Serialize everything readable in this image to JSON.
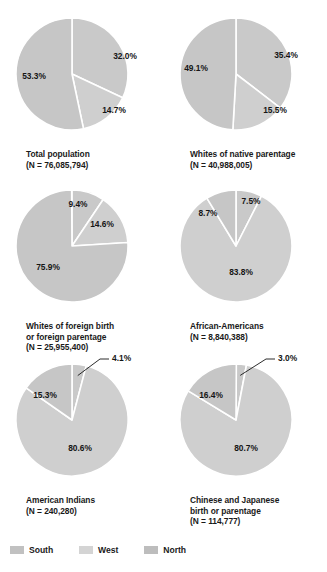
{
  "chart_data": [
    {
      "type": "pie",
      "title": "Total population",
      "subtitle": "(N = 76,085,794)",
      "categories": [
        "South",
        "West",
        "North"
      ],
      "values": [
        32.0,
        14.7,
        53.3
      ],
      "labels": [
        "32.0%",
        "14.7%",
        "53.3%"
      ],
      "start_angle_deg": 0,
      "direction": "clockwise",
      "legend": "bottom"
    },
    {
      "type": "pie",
      "title": "Whites of native parentage",
      "subtitle": "(N = 40,988,005)",
      "categories": [
        "South",
        "West",
        "North"
      ],
      "values": [
        35.4,
        15.5,
        49.1
      ],
      "labels": [
        "35.4%",
        "15.5%",
        "49.1%"
      ],
      "start_angle_deg": 0,
      "direction": "clockwise",
      "legend": "bottom"
    },
    {
      "type": "pie",
      "title_line1": "Whites of foreign birth",
      "title_line2": "or foreign parentage",
      "subtitle": "(N = 25,955,400)",
      "categories": [
        "South",
        "West",
        "North"
      ],
      "values": [
        9.4,
        14.6,
        75.9
      ],
      "labels": [
        "9.4%",
        "14.6%",
        "75.9%"
      ],
      "start_angle_deg": 0,
      "direction": "clockwise",
      "legend": "bottom"
    },
    {
      "type": "pie",
      "title": "African-Americans",
      "subtitle": "(N = 8,840,388)",
      "categories": [
        "South",
        "West",
        "North"
      ],
      "values": [
        7.5,
        83.8,
        8.7
      ],
      "labels": [
        "7.5%",
        "83.8%",
        "8.7%"
      ],
      "start_angle_deg": 0,
      "direction": "clockwise",
      "legend": "bottom"
    },
    {
      "type": "pie",
      "title": "American Indians",
      "subtitle": "(N = 240,280)",
      "categories": [
        "South",
        "West",
        "North"
      ],
      "values": [
        4.1,
        80.6,
        15.3
      ],
      "labels": [
        "4.1%",
        "80.6%",
        "15.3%"
      ],
      "start_angle_deg": 0,
      "direction": "clockwise",
      "legend": "bottom"
    },
    {
      "type": "pie",
      "title_line1": "Chinese and Japanese",
      "title_line2": "birth or parentage",
      "subtitle": "(N = 114,777)",
      "categories": [
        "South",
        "West",
        "North"
      ],
      "values": [
        3.0,
        80.7,
        16.4
      ],
      "labels": [
        "3.0%",
        "80.7%",
        "16.4%"
      ],
      "start_angle_deg": 0,
      "direction": "clockwise",
      "legend": "bottom"
    }
  ],
  "charts": [
    {
      "id": "total-population",
      "caption_lines": [
        "Total population",
        "(N = 76,085,794)"
      ],
      "slices": [
        {
          "label": "32.0%",
          "value": 32.0,
          "color": "#c9c9c9",
          "lx": 53,
          "ly": -18
        },
        {
          "label": "14.7%",
          "value": 14.7,
          "color": "#cfcfcf",
          "lx": 42,
          "ly": 36
        },
        {
          "label": "53.3%",
          "value": 53.3,
          "color": "#c6c6c6",
          "lx": -38,
          "ly": 2
        }
      ]
    },
    {
      "id": "whites-native-parentage",
      "caption_lines": [
        "Whites of native parentage",
        "(N = 40,988,005)"
      ],
      "slices": [
        {
          "label": "35.4%",
          "value": 35.4,
          "color": "#c9c9c9",
          "lx": 50,
          "ly": -19
        },
        {
          "label": "15.5%",
          "value": 15.5,
          "color": "#cfcfcf",
          "lx": 39,
          "ly": 36
        },
        {
          "label": "49.1%",
          "value": 49.1,
          "color": "#c6c6c6",
          "lx": -40,
          "ly": -6
        }
      ]
    },
    {
      "id": "whites-foreign-birth",
      "caption_lines": [
        "Whites of foreign birth",
        "or foreign parentage",
        "(N = 25,955,400)"
      ],
      "slices": [
        {
          "label": "9.4%",
          "value": 9.4,
          "color": "#c9c9c9",
          "lx": 6,
          "ly": -42
        },
        {
          "label": "14.6%",
          "value": 14.6,
          "color": "#cfcfcf",
          "lx": 30,
          "ly": -22
        },
        {
          "label": "75.9%",
          "value": 75.9,
          "color": "#c6c6c6",
          "lx": -24,
          "ly": 21
        }
      ]
    },
    {
      "id": "african-americans",
      "caption_lines": [
        "African-Americans",
        "(N = 8,840,388)"
      ],
      "slices": [
        {
          "label": "7.5%",
          "value": 7.5,
          "color": "#c9c9c9",
          "lx": 15,
          "ly": -45
        },
        {
          "label": "83.8%",
          "value": 83.8,
          "color": "#cfcfcf",
          "lx": 5,
          "ly": 26
        },
        {
          "label": "8.7%",
          "value": 8.7,
          "color": "#c6c6c6",
          "lx": -28,
          "ly": -33
        }
      ]
    },
    {
      "id": "american-indians",
      "caption_lines": [
        "American Indians",
        "(N = 240,280)"
      ],
      "slices": [
        {
          "label": "4.1%",
          "value": 4.1,
          "color": "#c9c9c9",
          "lx": 40,
          "ly": -62,
          "leader": true
        },
        {
          "label": "80.6%",
          "value": 80.6,
          "color": "#cfcfcf",
          "lx": 8,
          "ly": 28
        },
        {
          "label": "15.3%",
          "value": 15.3,
          "color": "#c6c6c6",
          "lx": -27,
          "ly": -25
        }
      ]
    },
    {
      "id": "chinese-japanese",
      "caption_lines": [
        "Chinese and Japanese",
        "birth or parentage",
        "(N = 114,777)"
      ],
      "slices": [
        {
          "label": "3.0%",
          "value": 3.0,
          "color": "#c9c9c9",
          "lx": 42,
          "ly": -62,
          "leader": true
        },
        {
          "label": "80.7%",
          "value": 80.7,
          "color": "#cfcfcf",
          "lx": 10,
          "ly": 28
        },
        {
          "label": "16.4%",
          "value": 16.4,
          "color": "#c6c6c6",
          "lx": -25,
          "ly": -25
        }
      ]
    }
  ],
  "legend": {
    "items": [
      {
        "label": "South",
        "color": "#c1c1c1"
      },
      {
        "label": "West",
        "color": "#d4d4d4"
      },
      {
        "label": "North",
        "color": "#bdbdbd"
      }
    ]
  }
}
